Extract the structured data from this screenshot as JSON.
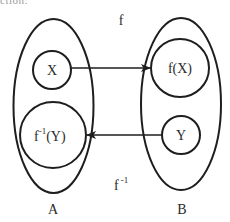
{
  "top_fragment": "ction:",
  "diagram": {
    "stroke_color": "#1e1e1e",
    "text_color": "#2a2a2a",
    "sets": [
      {
        "id": "A",
        "label": "A",
        "cx": 53.5,
        "cy": 106,
        "rx": 40,
        "ry": 87
      },
      {
        "id": "B",
        "label": "B",
        "cx": 181,
        "cy": 104,
        "rx": 40,
        "ry": 86
      }
    ],
    "subsets": [
      {
        "id": "X",
        "label": "X",
        "cx": 52,
        "cy": 70,
        "r": 19
      },
      {
        "id": "fX",
        "label": "f(X)",
        "cx": 180,
        "cy": 68,
        "r": 29
      },
      {
        "id": "finvY",
        "label_base": "f",
        "label_sup": "-1",
        "label_tail": "(Y)",
        "cx": 53,
        "cy": 135,
        "r": 33
      },
      {
        "id": "Y",
        "label": "Y",
        "cx": 181,
        "cy": 135,
        "r": 19
      }
    ],
    "arrows": [
      {
        "id": "f",
        "from": "X",
        "to": "f(X)",
        "label": "f"
      },
      {
        "id": "f_inverse",
        "from": "Y",
        "to": "f^-1(Y)",
        "label_base": "f",
        "label_sup": "-1"
      }
    ]
  }
}
